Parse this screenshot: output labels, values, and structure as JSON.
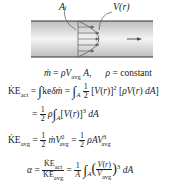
{
  "figure": {
    "label_area": "A",
    "label_profile": "V(r)",
    "pipe_color": "#cccccc",
    "profile_color": "#666666"
  },
  "equations": {
    "mass_flow": "ṁ = ρV_avg A,",
    "density_note": "ρ = constant",
    "ke_act_line1_lhs": "KE_act",
    "ke_act_line1_mid": "∫ ke δṁ",
    "ke_act_line1_rhs": "∫_A 1/2 [V(r)]² [ρV(r) dA]",
    "ke_act_line2": "= 1/2 ρ ∫_A [V(r)]³ dA",
    "ke_avg": "KE_avg = 1/2 ṁ V_avg² = 1/2 ρ A V_avg³",
    "alpha": "α = KE_act / KE_avg = 1/A ∫_A (V(r)/V_avg)³ dA"
  }
}
